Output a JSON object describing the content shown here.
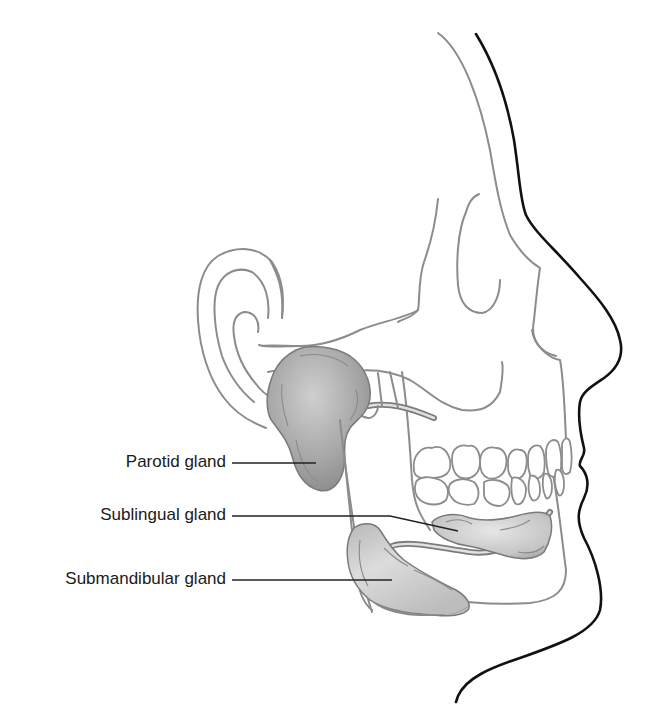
{
  "figure": {
    "colors": {
      "skin_outline": "#111111",
      "bone_outline": "#8c8c8c",
      "gland_fill_light": "#d4d4d4",
      "gland_fill_dark": "#8f8f8f",
      "background": "#ffffff"
    },
    "labels": [
      {
        "id": "parotid",
        "text": "Parotid gland"
      },
      {
        "id": "sublingual",
        "text": "Sublingual gland"
      },
      {
        "id": "submandibular",
        "text": "Submandibular gland"
      }
    ]
  }
}
